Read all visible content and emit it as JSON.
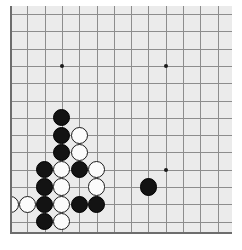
{
  "app": {
    "title": "Go Board Position",
    "board_size": 19,
    "view": "lower-left corner crop"
  },
  "board": {
    "background_color": "#ebebeb",
    "line_color": "#8d8d8d",
    "edge_color": "#6d6d6d",
    "page_background": "#ffffff",
    "origin_x": 10,
    "origin_y": 14,
    "spacing": 17.3,
    "visible_cols": 13,
    "visible_rows": 13,
    "stone_radius": 8.6
  },
  "colors": {
    "black_stone": "#131313",
    "white_stone": "#fbfbfb",
    "white_stone_border": "#1b1b1b",
    "hoshi": "#1a1a1a"
  },
  "grid": {
    "v_lines": [
      0,
      1,
      2,
      3,
      4,
      5,
      6,
      7,
      8,
      9,
      10,
      11,
      12
    ],
    "h_lines": [
      0,
      1,
      2,
      3,
      4,
      5,
      6,
      7,
      8,
      9,
      10,
      11,
      12
    ]
  },
  "star_points": [
    {
      "col": 3,
      "row": 3,
      "name": "hoshi-upper-left"
    },
    {
      "col": 9,
      "row": 3,
      "name": "hoshi-upper-right"
    },
    {
      "col": 9,
      "row": 9,
      "name": "hoshi-lower-right"
    }
  ],
  "stones": [
    {
      "col": 3,
      "row": 6,
      "color": "black"
    },
    {
      "col": 3,
      "row": 7,
      "color": "black"
    },
    {
      "col": 4,
      "row": 7,
      "color": "white"
    },
    {
      "col": 3,
      "row": 8,
      "color": "black"
    },
    {
      "col": 4,
      "row": 8,
      "color": "white"
    },
    {
      "col": 2,
      "row": 9,
      "color": "black"
    },
    {
      "col": 3,
      "row": 9,
      "color": "white"
    },
    {
      "col": 4,
      "row": 9,
      "color": "black"
    },
    {
      "col": 5,
      "row": 9,
      "color": "white"
    },
    {
      "col": 2,
      "row": 10,
      "color": "black"
    },
    {
      "col": 3,
      "row": 10,
      "color": "white"
    },
    {
      "col": 5,
      "row": 10,
      "color": "white"
    },
    {
      "col": 8,
      "row": 10,
      "color": "black"
    },
    {
      "col": 0,
      "row": 11,
      "color": "white"
    },
    {
      "col": 1,
      "row": 11,
      "color": "white"
    },
    {
      "col": 2,
      "row": 11,
      "color": "black"
    },
    {
      "col": 3,
      "row": 11,
      "color": "white"
    },
    {
      "col": 4,
      "row": 11,
      "color": "black"
    },
    {
      "col": 5,
      "row": 11,
      "color": "black"
    },
    {
      "col": 2,
      "row": 12,
      "color": "black"
    },
    {
      "col": 3,
      "row": 12,
      "color": "white"
    }
  ],
  "counts": {
    "black_stones": 11,
    "white_stones": 10,
    "total_stones": 21
  }
}
